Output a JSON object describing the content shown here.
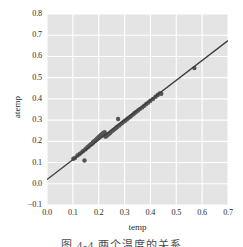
{
  "figure": {
    "background_color": "#ffffff",
    "axes_background_color": "#e4e4e4",
    "grid_color": "#ffffff",
    "marker_color": "#555555",
    "line_color": "#3d3d3d"
  },
  "caption": {
    "text": "图 4-4 两个温度的关系"
  },
  "chart_data": {
    "type": "scatter",
    "title": "",
    "xlabel": "temp",
    "ylabel": "atemp",
    "xlim": [
      0.0,
      0.7
    ],
    "ylim": [
      -0.1,
      0.8
    ],
    "xticks": [
      0.0,
      0.1,
      0.2,
      0.3,
      0.4,
      0.5,
      0.6,
      0.7
    ],
    "yticks": [
      -0.1,
      0.0,
      0.1,
      0.2,
      0.3,
      0.4,
      0.5,
      0.6,
      0.7,
      0.8
    ],
    "xtick_labels": [
      "0.0",
      "0.1",
      "0.2",
      "0.3",
      "0.4",
      "0.5",
      "0.6",
      "0.7"
    ],
    "ytick_labels": [
      "-0.1",
      "0.0",
      "0.1",
      "0.2",
      "0.3",
      "0.4",
      "0.5",
      "0.6",
      "0.7",
      "0.8"
    ],
    "grid": true,
    "legend": null,
    "series": [
      {
        "name": "observations",
        "type": "scatter",
        "marker_size": 2.2,
        "points": [
          [
            0.102,
            0.118
          ],
          [
            0.108,
            0.122
          ],
          [
            0.118,
            0.133
          ],
          [
            0.126,
            0.14
          ],
          [
            0.134,
            0.148
          ],
          [
            0.14,
            0.155
          ],
          [
            0.145,
            0.11
          ],
          [
            0.148,
            0.162
          ],
          [
            0.152,
            0.167
          ],
          [
            0.157,
            0.172
          ],
          [
            0.16,
            0.175
          ],
          [
            0.164,
            0.18
          ],
          [
            0.168,
            0.184
          ],
          [
            0.172,
            0.188
          ],
          [
            0.175,
            0.19
          ],
          [
            0.178,
            0.195
          ],
          [
            0.18,
            0.198
          ],
          [
            0.183,
            0.2
          ],
          [
            0.186,
            0.203
          ],
          [
            0.189,
            0.206
          ],
          [
            0.192,
            0.21
          ],
          [
            0.195,
            0.213
          ],
          [
            0.198,
            0.216
          ],
          [
            0.2,
            0.219
          ],
          [
            0.203,
            0.222
          ],
          [
            0.206,
            0.226
          ],
          [
            0.208,
            0.229
          ],
          [
            0.211,
            0.231
          ],
          [
            0.214,
            0.235
          ],
          [
            0.217,
            0.238
          ],
          [
            0.22,
            0.24
          ],
          [
            0.223,
            0.243
          ],
          [
            0.226,
            0.222
          ],
          [
            0.229,
            0.225
          ],
          [
            0.232,
            0.228
          ],
          [
            0.236,
            0.232
          ],
          [
            0.24,
            0.236
          ],
          [
            0.245,
            0.24
          ],
          [
            0.25,
            0.247
          ],
          [
            0.256,
            0.252
          ],
          [
            0.262,
            0.258
          ],
          [
            0.268,
            0.264
          ],
          [
            0.272,
            0.269
          ],
          [
            0.275,
            0.305
          ],
          [
            0.278,
            0.274
          ],
          [
            0.284,
            0.28
          ],
          [
            0.29,
            0.286
          ],
          [
            0.296,
            0.292
          ],
          [
            0.302,
            0.297
          ],
          [
            0.308,
            0.303
          ],
          [
            0.314,
            0.309
          ],
          [
            0.32,
            0.314
          ],
          [
            0.326,
            0.32
          ],
          [
            0.332,
            0.326
          ],
          [
            0.338,
            0.332
          ],
          [
            0.344,
            0.338
          ],
          [
            0.352,
            0.345
          ],
          [
            0.36,
            0.353
          ],
          [
            0.368,
            0.36
          ],
          [
            0.376,
            0.368
          ],
          [
            0.384,
            0.376
          ],
          [
            0.392,
            0.383
          ],
          [
            0.4,
            0.391
          ],
          [
            0.41,
            0.4
          ],
          [
            0.42,
            0.41
          ],
          [
            0.428,
            0.418
          ],
          [
            0.436,
            0.426
          ],
          [
            0.442,
            0.424
          ],
          [
            0.57,
            0.545
          ]
        ]
      },
      {
        "name": "regression-line",
        "type": "line",
        "x": [
          0.0,
          0.7
        ],
        "y": [
          0.02,
          0.675
        ],
        "slope": 0.9357,
        "intercept": 0.02
      }
    ]
  }
}
